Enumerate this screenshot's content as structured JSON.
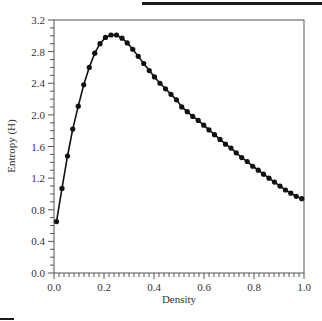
{
  "chart_data": {
    "type": "line",
    "title": "",
    "xlabel": "Density",
    "ylabel": "Entropy (H)",
    "xlim": [
      0.0,
      1.0
    ],
    "ylim": [
      0.0,
      3.2
    ],
    "xticks": [
      "0.0",
      "0.2",
      "0.4",
      "0.6",
      "0.8",
      "1.0"
    ],
    "yticks": [
      "0.0",
      "0.4",
      "0.8",
      "1.2",
      "1.6",
      "2.0",
      "2.4",
      "2.8",
      "3.2"
    ],
    "x_minor_step": 0.02,
    "y_minor_step": 0.1,
    "grid": false,
    "legend": null,
    "series": [
      {
        "name": "Entropy",
        "marker": "circle",
        "color": "#111111",
        "x": [
          0.01,
          0.032,
          0.054,
          0.075,
          0.097,
          0.119,
          0.141,
          0.163,
          0.184,
          0.206,
          0.228,
          0.25,
          0.272,
          0.293,
          0.315,
          0.337,
          0.359,
          0.381,
          0.402,
          0.424,
          0.446,
          0.468,
          0.49,
          0.511,
          0.533,
          0.555,
          0.577,
          0.599,
          0.62,
          0.642,
          0.664,
          0.686,
          0.708,
          0.729,
          0.751,
          0.773,
          0.795,
          0.817,
          0.838,
          0.86,
          0.882,
          0.904,
          0.926,
          0.947,
          0.969,
          0.991
        ],
        "y": [
          0.65,
          1.07,
          1.48,
          1.82,
          2.11,
          2.38,
          2.6,
          2.78,
          2.9,
          2.98,
          3.01,
          3.01,
          2.97,
          2.91,
          2.83,
          2.74,
          2.65,
          2.56,
          2.48,
          2.4,
          2.33,
          2.26,
          2.19,
          2.1,
          2.04,
          1.98,
          1.93,
          1.87,
          1.81,
          1.75,
          1.69,
          1.63,
          1.58,
          1.52,
          1.46,
          1.41,
          1.35,
          1.3,
          1.25,
          1.2,
          1.15,
          1.1,
          1.05,
          1.01,
          0.97,
          0.94
        ]
      }
    ]
  }
}
